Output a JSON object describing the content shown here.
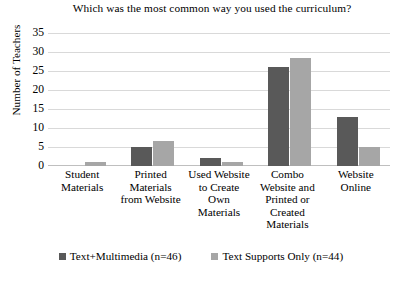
{
  "chart_data": {
    "type": "bar",
    "title": "Which was the most common way you used the curriculum?",
    "xlabel": "",
    "ylabel": "Number of Teachers",
    "ylim": [
      0,
      35
    ],
    "ytick_step": 5,
    "yticks": [
      35,
      30,
      25,
      20,
      15,
      10,
      5,
      0
    ],
    "grid": true,
    "legend_position": "bottom",
    "categories": [
      "Student Materials",
      "Printed Materials from Website",
      "Used Website to Create Own Materials",
      "Combo Website and Printed or Created Materials",
      "Website Online"
    ],
    "category_lines": [
      [
        "Student",
        "Materials"
      ],
      [
        "Printed",
        "Materials",
        "from Website"
      ],
      [
        "Used Website",
        "to Create",
        "Own",
        "Materials"
      ],
      [
        "Combo",
        "Website and",
        "Printed or",
        "Created",
        "Materials"
      ],
      [
        "Website",
        "Online"
      ]
    ],
    "series": [
      {
        "name": "Text+Multimedia (n=46)",
        "color": "#595959",
        "values": [
          0,
          5,
          2,
          26,
          13
        ]
      },
      {
        "name": "Text Supports Only (n=44)",
        "color": "#a6a6a6",
        "values": [
          1,
          6.5,
          1,
          28.5,
          5
        ]
      }
    ]
  },
  "legend": {
    "items": [
      {
        "label": "Text+Multimedia (n=46)",
        "color": "#595959"
      },
      {
        "label": "Text Supports Only (n=44)",
        "color": "#a6a6a6"
      }
    ]
  }
}
